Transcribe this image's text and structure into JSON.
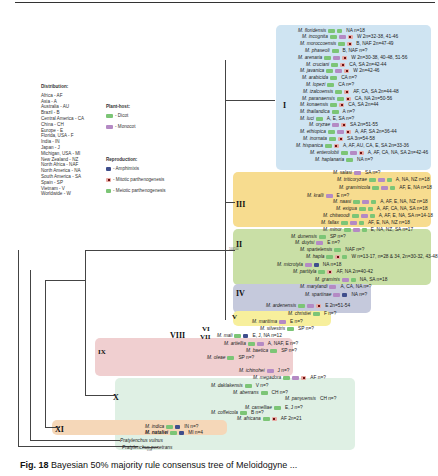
{
  "figure": {
    "caption_label": "Fig. 18",
    "caption_text": "Bayesian 50% majority rule consensus tree of Meloidogyne ..."
  },
  "legend": {
    "distribution_title": "Distribution:",
    "distribution": [
      "Africa - AF",
      "Asia - A",
      "Australia - AU",
      "Brazil - B",
      "Central America - CA",
      "China - CH",
      "Europe - E",
      "Florida, USA - F",
      "India - IN",
      "Japan - J",
      "Michigan, USA - MI",
      "New Zealand - NZ",
      "North Africa - NAF",
      "North America - NA",
      "South America - SA",
      "Spain - SP",
      "Vietnam - V",
      "Worldwide - W"
    ],
    "plant_host_title": "Plant-host:",
    "plant_host": [
      {
        "type": "dicot",
        "label": "- Dicot"
      },
      {
        "type": "monocot",
        "label": "- Monocot"
      }
    ],
    "reproduction_title": "Reproduction:",
    "reproduction": [
      {
        "type": "amph",
        "label": "- Amphimixis"
      },
      {
        "type": "mitotic",
        "label": "- Mitotic parthenogenesis"
      },
      {
        "type": "meiotic",
        "label": "- Meiotic parthenogenesis"
      }
    ]
  },
  "clades": [
    {
      "id": "I",
      "label": "I",
      "color": "#cfe4f2"
    },
    {
      "id": "III",
      "label": "III",
      "color": "#f7dc8f"
    },
    {
      "id": "II",
      "label": "II",
      "color": "#c9dfa6"
    },
    {
      "id": "IV",
      "label": "IV",
      "color": "#c5c9dc"
    },
    {
      "id": "V",
      "label": "V",
      "color": "#f7ef9c"
    },
    {
      "id": "VI",
      "label": "VI",
      "color": "none"
    },
    {
      "id": "VII",
      "label": "VII",
      "color": "none"
    },
    {
      "id": "VIII",
      "label": "VIII",
      "color": "none"
    },
    {
      "id": "IX",
      "label": "IX",
      "color": "#f0cfd0"
    },
    {
      "id": "X",
      "label": "X",
      "color": "#dff0e4"
    },
    {
      "id": "XI",
      "label": "XI",
      "color": "#f5d7b8"
    }
  ],
  "taxa": [
    {
      "name": "M. floridensis",
      "icons": [
        "dicot",
        "meiotic"
      ],
      "meta": "NA  n=18"
    },
    {
      "name": "M. incognita",
      "icons": [
        "dicot",
        "monocot",
        "mitotic"
      ],
      "meta": "W  2n=32-38, 41-46"
    },
    {
      "name": "M. moroccoensis",
      "icons": [
        "dicot",
        "mitotic"
      ],
      "meta": "B, NAF  2n=47-49"
    },
    {
      "name": "M. phaseoli",
      "icons": [
        "dicot"
      ],
      "meta": "B, NAF  n=?"
    },
    {
      "name": "M. arenaria",
      "icons": [
        "dicot",
        "monocot",
        "mitotic"
      ],
      "meta": "W  2n=30-38, 40-48, 51-56"
    },
    {
      "name": "M. cruciani",
      "icons": [
        "dicot",
        "mitotic"
      ],
      "meta": "CA, SA  2n=42-44"
    },
    {
      "name": "M. javanica",
      "icons": [
        "dicot",
        "monocot",
        "mitotic"
      ],
      "meta": "W  2n=42-46"
    },
    {
      "name": "M. arabicida",
      "icons": [
        "dicot"
      ],
      "meta": "CA  n=?"
    },
    {
      "name": "M. lopezi",
      "icons": [
        "dicot"
      ],
      "meta": "CA  n=?"
    },
    {
      "name": "M. izalcoensis",
      "icons": [
        "dicot",
        "mitotic"
      ],
      "meta": "AF, CA, SA  2n=44-48"
    },
    {
      "name": "M. paranaensis",
      "icons": [
        "dicot",
        "mitotic"
      ],
      "meta": "CA, NA  2n=50-56"
    },
    {
      "name": "M. konaensis",
      "icons": [
        "dicot",
        "mitotic"
      ],
      "meta": "CA, SA  2n=44"
    },
    {
      "name": "M. thailandica",
      "icons": [
        "dicot"
      ],
      "meta": "A  n=?"
    },
    {
      "name": "M. luci",
      "icons": [
        "dicot"
      ],
      "meta": "A, E, SA  n=?"
    },
    {
      "name": "M. oryzae",
      "icons": [
        "monocot",
        "mitotic"
      ],
      "meta": "SA  2n=51-55"
    },
    {
      "name": "M. ethiopica",
      "icons": [
        "dicot",
        "monocot",
        "mitotic"
      ],
      "meta": "A, AF, SA  2n=36-44"
    },
    {
      "name": "M. inornata",
      "icons": [
        "dicot",
        "mitotic"
      ],
      "meta": "SA  3n=54-58"
    },
    {
      "name": "M. hispanica",
      "icons": [
        "dicot",
        "mitotic"
      ],
      "meta": "A, AF, AU, CA, E, SA  2n=33-36"
    },
    {
      "name": "M. enterolobii",
      "icons": [
        "dicot",
        "monocot",
        "mitotic"
      ],
      "meta": "A, AF, CA, NA, SA  2n=42-46"
    },
    {
      "name": "M. haplanaria",
      "icons": [
        "dicot"
      ],
      "meta": "NA  n=?"
    },
    {
      "name": "M. salasi",
      "icons": [
        "monocot"
      ],
      "meta": "SA  n=?"
    },
    {
      "name": "M. triticoryzae",
      "icons": [
        "dicot",
        "monocot",
        "meiotic"
      ],
      "meta": "A, NA, NZ  n=18"
    },
    {
      "name": "M. graminicola",
      "icons": [
        "dicot",
        "monocot",
        "meiotic"
      ],
      "meta": "AF, E, NA  n=18"
    },
    {
      "name": "M. kralli",
      "icons": [
        "monocot"
      ],
      "meta": "E  n=?"
    },
    {
      "name": "M. naasi",
      "icons": [
        "dicot",
        "monocot",
        "meiotic"
      ],
      "meta": "A, AF, E, NA, NZ  n=18"
    },
    {
      "name": "M. exigua",
      "icons": [
        "dicot",
        "meiotic"
      ],
      "meta": "A, AF, CA, NA, SA  n=18"
    },
    {
      "name": "M. chitwoodi",
      "icons": [
        "dicot",
        "monocot",
        "meiotic"
      ],
      "meta": "A, AF, E, NA, SA  n=14-18"
    },
    {
      "name": "M. fallax",
      "icons": [
        "dicot",
        "monocot",
        "meiotic"
      ],
      "meta": "AF, E, NA, NZ  n=18"
    },
    {
      "name": "M. minor",
      "icons": [
        "dicot",
        "monocot",
        "meiotic"
      ],
      "meta": "E, NA, NZ, SA  n=17"
    },
    {
      "name": "M. dunensis",
      "icons": [
        "dicot"
      ],
      "meta": "SP  n=?"
    },
    {
      "name": "M. duytsi",
      "icons": [
        "monocot"
      ],
      "meta": "E  n=?"
    },
    {
      "name": "M. spartelensis",
      "icons": [
        "dicot"
      ],
      "meta": "NAF  n=?"
    },
    {
      "name": "M. hapla",
      "icons": [
        "dicot",
        "mitotic",
        "meiotic"
      ],
      "meta": "W  n=13-17, n=28 & 34, 2n=30-32, 43-48"
    },
    {
      "name": "M. microtyla",
      "icons": [
        "monocot",
        "amph"
      ],
      "meta": "NA  n=18"
    },
    {
      "name": "M. partityla",
      "icons": [
        "dicot",
        "mitotic"
      ],
      "meta": "AF, NA  2n=40-42"
    },
    {
      "name": "M. graminis",
      "icons": [
        "monocot",
        "meiotic"
      ],
      "meta": "NA, SA  n=18"
    },
    {
      "name": "M. marylandi",
      "icons": [
        "monocot"
      ],
      "meta": "A, CA, NA  n=?"
    },
    {
      "name": "M. spartinae",
      "icons": [
        "monocot",
        "amph"
      ],
      "meta": "NA  n=?"
    },
    {
      "name": "M. ardenensis",
      "icons": [
        "dicot",
        "monocot",
        "mitotic"
      ],
      "meta": "E  2n=51-54"
    },
    {
      "name": "M. christiei",
      "icons": [
        "dicot"
      ],
      "meta": "F  n=?"
    },
    {
      "name": "M. maritima",
      "icons": [
        "monocot"
      ],
      "meta": "E  n=?"
    },
    {
      "name": "M. silvestris",
      "icons": [
        "dicot"
      ],
      "meta": "SP  n=?"
    },
    {
      "name": "M. mali",
      "icons": [
        "dicot",
        "amph"
      ],
      "meta": "E, J, NA  n=12"
    },
    {
      "name": "M. artiellia",
      "icons": [
        "dicot",
        "monocot"
      ],
      "meta": "A, NAF, E  n=?"
    },
    {
      "name": "M. baetica",
      "icons": [
        "dicot"
      ],
      "meta": "SP  n=?"
    },
    {
      "name": "M. oleae",
      "icons": [
        "dicot"
      ],
      "meta": "SP  n=?"
    },
    {
      "name": "M. ichinohei",
      "icons": [
        "monocot"
      ],
      "meta": "J  n=?"
    },
    {
      "name": "M. megadora",
      "icons": [
        "dicot",
        "monocot",
        "mitotic"
      ],
      "meta": "AF  n=?"
    },
    {
      "name": "M. daklakensis",
      "icons": [
        "dicot"
      ],
      "meta": "V  n=?"
    },
    {
      "name": "M. aberrans",
      "icons": [
        "dicot"
      ],
      "meta": "CH  n=?"
    },
    {
      "name": "M. panyuensis",
      "icons": [],
      "meta": "CH  n=?"
    },
    {
      "name": "M. camelliae",
      "icons": [
        "dicot"
      ],
      "meta": "E, J  n=?"
    },
    {
      "name": "M. coffeicola",
      "icons": [
        "dicot"
      ],
      "meta": "B  n=?"
    },
    {
      "name": "M. africana",
      "icons": [
        "dicot",
        "mitotic"
      ],
      "meta": "AF  2n=21"
    },
    {
      "name": "M. indica",
      "icons": [
        "dicot",
        "amph"
      ],
      "meta": "IN  n=?"
    },
    {
      "name": "M. nataliei",
      "bold": true,
      "icons": [
        "dicot",
        "amph"
      ],
      "meta": "MI  n=4"
    },
    {
      "name": "Pratylenchus vulnus",
      "icons": [],
      "meta": ""
    },
    {
      "name": "Pratylenchus penetrans",
      "icons": [],
      "meta": ""
    }
  ]
}
